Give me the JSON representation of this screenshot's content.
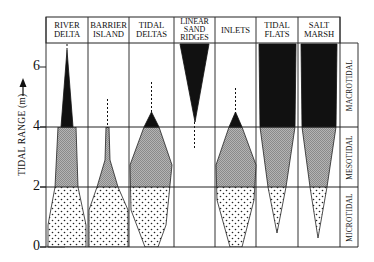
{
  "figure": {
    "y_axis": {
      "label": "TIDAL RANGE (m)",
      "arrow": "up-arrow",
      "ticks": [
        "0",
        "2",
        "4",
        "6"
      ]
    },
    "columns": [
      {
        "line1": "RIVER",
        "line2": "DELTA"
      },
      {
        "line1": "BARRIER",
        "line2": "ISLAND"
      },
      {
        "line1": "TIDAL",
        "line2": "DELTAS"
      },
      {
        "line1": "LINEAR",
        "line2": "SAND",
        "line3": "RIDGES"
      },
      {
        "line1": "INLETS",
        "line2": ""
      },
      {
        "line1": "TIDAL",
        "line2": "FLATS"
      },
      {
        "line1": "SALT",
        "line2": "MARSH"
      }
    ],
    "regimes": {
      "macro": "MACROTIDAL",
      "meso": "MESOTIDAL",
      "micro": "MICROTIDAL"
    },
    "legend_fills": {
      "macrotidal_fill": "#111111",
      "mesotidal_fill": "#a8a8a8",
      "microtidal_fill": "dotted-white"
    },
    "thresholds_m": [
      2,
      4
    ]
  }
}
